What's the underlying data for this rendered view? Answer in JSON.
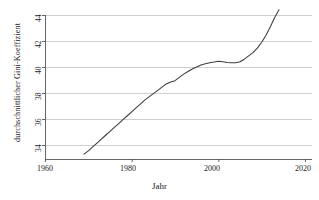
{
  "chart_data": {
    "type": "line",
    "title": "",
    "xlabel": "Jahr",
    "ylabel": "durchschnittlicher Gini-Koeffizient",
    "xlim": [
      1960,
      2020
    ],
    "ylim": [
      33.0,
      44.8
    ],
    "xticks": [
      1960,
      1980,
      2000,
      2020
    ],
    "yticks": [
      34,
      36,
      38,
      40,
      42,
      44
    ],
    "grid": "horizontal",
    "legend": "none",
    "line_color": "#3a3a3a",
    "grid_color": "#c9c9c9",
    "axis_color": "#555555",
    "series": [
      {
        "name": "durchschnittlicher Gini-Koeffizient",
        "x": [
          1969,
          1970,
          1971,
          1972,
          1973,
          1974,
          1975,
          1976,
          1977,
          1978,
          1979,
          1980,
          1981,
          1982,
          1983,
          1984,
          1985,
          1986,
          1987,
          1988,
          1989,
          1990,
          1991,
          1992,
          1993,
          1994,
          1995,
          1996,
          1997,
          1998,
          1999,
          2000,
          2001,
          2002,
          2003,
          2004,
          2005,
          2006,
          2007,
          2008,
          2009,
          2010,
          2011,
          2012,
          2013,
          2014
        ],
        "y": [
          33.3,
          33.55,
          33.85,
          34.15,
          34.45,
          34.75,
          35.05,
          35.35,
          35.65,
          35.95,
          36.25,
          36.55,
          36.85,
          37.15,
          37.45,
          37.7,
          37.95,
          38.2,
          38.45,
          38.7,
          38.85,
          38.95,
          39.2,
          39.45,
          39.65,
          39.85,
          40.0,
          40.15,
          40.25,
          40.32,
          40.38,
          40.45,
          40.4,
          40.35,
          40.33,
          40.32,
          40.4,
          40.6,
          40.85,
          41.1,
          41.45,
          41.9,
          42.45,
          43.1,
          43.8,
          44.4
        ]
      }
    ]
  },
  "axis": {
    "ytick_labels": [
      "34",
      "36",
      "38",
      "40",
      "42",
      "44"
    ],
    "xtick_labels": [
      "1960",
      "1980",
      "2000",
      "2020"
    ]
  }
}
